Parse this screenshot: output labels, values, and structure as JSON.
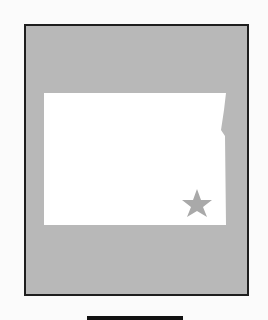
{
  "map": {
    "region_name": "North Dakota",
    "shape": "state-outline",
    "marker": {
      "type": "star",
      "label": "capital-marker"
    },
    "colors": {
      "background": "#b8b8b8",
      "state_fill": "#ffffff",
      "star_fill": "#a9a9a9",
      "border": "#1e1e1e",
      "footer_bar": "#111111"
    }
  }
}
